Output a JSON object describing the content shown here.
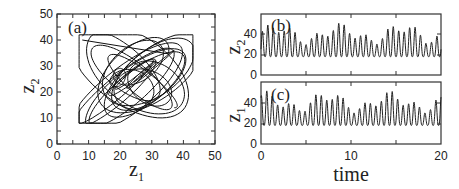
{
  "chart_data": [
    {
      "panel": "(a)",
      "type": "line",
      "title": "",
      "xlabel": "z1",
      "ylabel": "z2",
      "xlim": [
        0,
        50
      ],
      "ylim": [
        0,
        50
      ],
      "xticks": [
        0,
        10,
        20,
        30,
        40,
        50
      ],
      "yticks": [
        0,
        10,
        20,
        30,
        40,
        50
      ],
      "grid": false,
      "description": "Phase-space trajectory of z2 vs z1 filling roughly the region z1 in [7,43], z2 in [8,42]"
    },
    {
      "panel": "(b)",
      "type": "line",
      "xlabel": "",
      "ylabel": "z2",
      "xlim": [
        0,
        20
      ],
      "ylim": [
        0,
        60
      ],
      "yticks": [
        0,
        20,
        40
      ],
      "grid": false,
      "description": "Oscillatory time series of z2, ~33 peaks over time 0-20, peaks ~30-45, troughs ~8-20"
    },
    {
      "panel": "(c)",
      "type": "line",
      "xlabel": "time",
      "ylabel": "z1",
      "xlim": [
        0,
        20
      ],
      "ylim": [
        0,
        60
      ],
      "xticks": [
        0,
        10,
        20
      ],
      "yticks": [
        0,
        20,
        40
      ],
      "grid": false,
      "description": "Oscillatory time series of z1, ~33 peaks over time 0-20, peaks ~35-45, troughs ~8-20"
    }
  ],
  "labels": {
    "panel_a": "(a)",
    "panel_b": "(b)",
    "panel_c": "(c)",
    "a_xlabel": "z",
    "a_xlabel_sub": "1",
    "a_ylabel": "z",
    "a_ylabel_sub": "2",
    "b_ylabel": "z",
    "b_ylabel_sub": "2",
    "c_ylabel": "z",
    "c_ylabel_sub": "1",
    "time_label": "time"
  },
  "ticks": {
    "a_x": [
      "0",
      "10",
      "20",
      "30",
      "40",
      "50"
    ],
    "a_y": [
      "0",
      "10",
      "20",
      "30",
      "40",
      "50"
    ],
    "b_y": [
      "0",
      "20",
      "40"
    ],
    "c_y": [
      "0",
      "20",
      "40"
    ],
    "c_x": [
      "0",
      "10",
      "20"
    ]
  }
}
